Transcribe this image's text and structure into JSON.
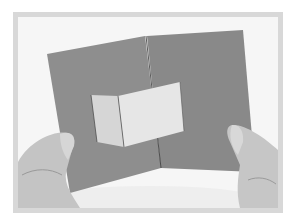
{
  "image": {
    "description": "Grayscale photograph of two hands holding open a gray folded card with a light pop-up panel in the center",
    "colors": {
      "page_background": "#ffffff",
      "frame": "#d8d8d8",
      "photo_background": "#f6f6f6",
      "card": "#8c8c8c",
      "card_shadow": "#7a7a7a",
      "popup_panel": "#e4e4e4",
      "popup_panel_left": "#dadada",
      "skin": "#c8c8c8",
      "skin_shadow": "#9a9a9a"
    }
  }
}
